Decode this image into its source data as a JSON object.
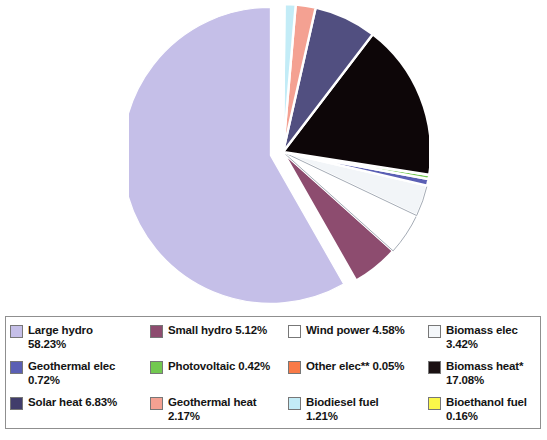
{
  "chart_data": {
    "type": "pie",
    "title": "",
    "subtitle": "",
    "xlabel": "",
    "ylabel": "",
    "legend_position": "bottom",
    "grid": false,
    "units": "percent",
    "exploded_slice": "Large hydro",
    "start_angle_deg": 0,
    "direction": "counterclockwise",
    "categories": [
      "Large hydro",
      "Small hydro",
      "Wind power",
      "Biomass elec",
      "Geothermal elec",
      "Photovoltaic",
      "Other elec**",
      "Biomass heat*",
      "Solar heat",
      "Geothermal heat",
      "Biodiesel fuel",
      "Bioethanol fuel"
    ],
    "values": [
      58.23,
      5.12,
      4.58,
      3.42,
      0.72,
      0.42,
      0.05,
      17.08,
      6.83,
      2.17,
      1.21,
      0.16
    ],
    "colors": [
      "#c5bfe8",
      "#8d4c6f",
      "#ffffff",
      "#f2f5f8",
      "#5a5fb4",
      "#72c850",
      "#f97a47",
      "#0d0608",
      "#514f80",
      "#f4a192",
      "#c3ecf7",
      "#fbf84a"
    ],
    "slices": [
      {
        "label": "Large hydro",
        "value": 58.23,
        "color": "#c5bfe8",
        "exploded": true
      },
      {
        "label": "Small hydro",
        "value": 5.12,
        "color": "#8d4c6f",
        "exploded": false
      },
      {
        "label": "Wind power",
        "value": 4.58,
        "color": "#ffffff",
        "exploded": false
      },
      {
        "label": "Biomass elec",
        "value": 3.42,
        "color": "#f2f5f8",
        "exploded": false
      },
      {
        "label": "Geothermal elec",
        "value": 0.72,
        "color": "#5a5fb4",
        "exploded": false
      },
      {
        "label": "Photovoltaic",
        "value": 0.42,
        "color": "#72c850",
        "exploded": false
      },
      {
        "label": "Other elec**",
        "value": 0.05,
        "color": "#f97a47",
        "exploded": false
      },
      {
        "label": "Biomass heat*",
        "value": 17.08,
        "color": "#0d0608",
        "exploded": false
      },
      {
        "label": "Solar heat",
        "value": 6.83,
        "color": "#514f80",
        "exploded": false
      },
      {
        "label": "Geothermal heat",
        "value": 2.17,
        "color": "#f4a192",
        "exploded": false
      },
      {
        "label": "Biodiesel fuel",
        "value": 1.21,
        "color": "#c3ecf7",
        "exploded": false
      },
      {
        "label": "Bioethanol fuel",
        "value": 0.16,
        "color": "#fbf84a",
        "exploded": false
      }
    ]
  },
  "legend": {
    "items": [
      {
        "label": "Large hydro\n58.23%",
        "swatch": "#c5bfe8",
        "name": "legend-large-hydro"
      },
      {
        "label": "Small hydro 5.12%",
        "swatch": "#8d4c6f",
        "name": "legend-small-hydro"
      },
      {
        "label": "Wind power 4.58%",
        "swatch": "#ffffff",
        "name": "legend-wind-power"
      },
      {
        "label": "Biomass elec\n3.42%",
        "swatch": "#f4f7fa",
        "name": "legend-biomass-elec"
      },
      {
        "label": "Geothermal elec\n0.72%",
        "swatch": "#5a5fb4",
        "name": "legend-geothermal-elec"
      },
      {
        "label": "Photovoltaic 0.42%",
        "swatch": "#72c850",
        "name": "legend-photovoltaic"
      },
      {
        "label": "Other elec** 0.05%",
        "swatch": "#f97a47",
        "name": "legend-other-elec"
      },
      {
        "label": "Biomass heat*\n17.08%",
        "swatch": "#1a1012",
        "name": "legend-biomass-heat"
      },
      {
        "label": "Solar heat 6.83%",
        "swatch": "#413d6b",
        "name": "legend-solar-heat"
      },
      {
        "label": "Geothermal heat\n2.17%",
        "swatch": "#f4a192",
        "name": "legend-geothermal-heat"
      },
      {
        "label": "Biodiesel fuel\n1.21%",
        "swatch": "#c3ecf7",
        "name": "legend-biodiesel-fuel"
      },
      {
        "label": "Bioethanol fuel\n0.16%",
        "swatch": "#fbf84a",
        "name": "legend-bioethanol-fuel"
      }
    ]
  }
}
